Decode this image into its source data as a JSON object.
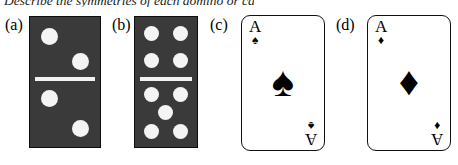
{
  "prompt": {
    "text": "Describe the symmetries of each domino or card."
  },
  "colors": {
    "domino_face": "#3a3a3a",
    "domino_border": "#0e0e0e",
    "pip": "#f4f4f4",
    "divider": "#f2f2f2",
    "card_face": "#ffffff",
    "card_border": "#111111",
    "suit": "#000000"
  },
  "figure": {
    "items": [
      {
        "label": "(a)",
        "kind": "domino",
        "top_half_pips": 2,
        "bottom_half_pips": 2,
        "top_arrangement": "diagonal",
        "bottom_arrangement": "diagonal"
      },
      {
        "label": "(b)",
        "kind": "domino",
        "top_half_pips": 4,
        "bottom_half_pips": 5,
        "top_arrangement": "square-four",
        "bottom_arrangement": "quincunx-five"
      },
      {
        "label": "(c)",
        "kind": "card",
        "rank": "A",
        "suit_name": "spade",
        "suit_glyph": "♠"
      },
      {
        "label": "(d)",
        "kind": "card",
        "rank": "A",
        "suit_name": "diamond",
        "suit_glyph": "♦"
      }
    ]
  }
}
